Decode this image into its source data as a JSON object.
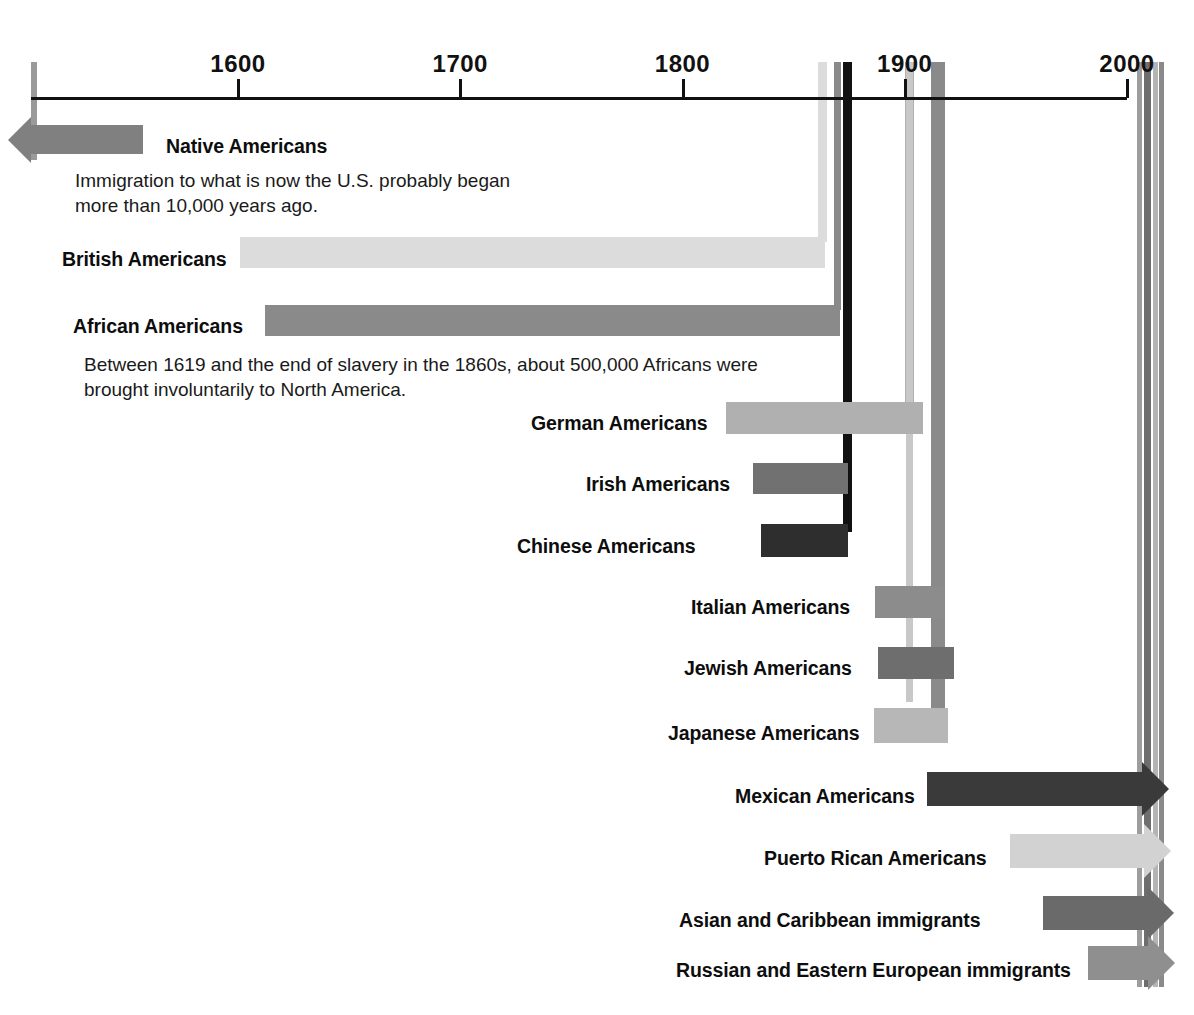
{
  "chart_data": {
    "type": "bar",
    "orientation": "horizontal-timeline",
    "title": "",
    "xlabel": "",
    "ylabel": "",
    "grid": false,
    "legend": null,
    "axis": {
      "ticks": [
        {
          "label": "1600",
          "value": 1600
        },
        {
          "label": "1700",
          "value": 1700
        },
        {
          "label": "1800",
          "value": 1800
        },
        {
          "label": "1900",
          "value": 1900
        },
        {
          "label": "2000",
          "value": 2000
        }
      ],
      "xlim": [
        1540,
        2010
      ]
    },
    "categories": [
      "Native Americans",
      "British Americans",
      "African Americans",
      "German Americans",
      "Irish Americans",
      "Chinese Americans",
      "Italian Americans",
      "Jewish Americans",
      "Japanese Americans",
      "Mexican Americans",
      "Puerto Rican Americans",
      "Asian and Caribbean immigrants",
      "Russian and Eastern European immigrants"
    ],
    "bars": [
      {
        "label": "Native Americans",
        "start": 1540,
        "end": 1600,
        "open_start": true,
        "open_end": false,
        "color": "#808080"
      },
      {
        "label": "British Americans",
        "start": 1600,
        "end": 1893,
        "open_start": false,
        "open_end": false,
        "color": "#dcdcdc"
      },
      {
        "label": "African Americans",
        "start": 1619,
        "end": 1900,
        "open_start": false,
        "open_end": false,
        "color": "#8a8a8a"
      },
      {
        "label": "German Americans",
        "start": 1828,
        "end": 1917,
        "open_start": false,
        "open_end": false,
        "color": "#b0b0b0"
      },
      {
        "label": "Irish Americans",
        "start": 1845,
        "end": 1899,
        "open_start": false,
        "open_end": false,
        "color": "#717171"
      },
      {
        "label": "Chinese Americans",
        "start": 1850,
        "end": 1900,
        "open_start": false,
        "open_end": false,
        "color": "#2e2e2e"
      },
      {
        "label": "Italian Americans",
        "start": 1880,
        "end": 1924,
        "open_start": false,
        "open_end": false,
        "color": "#8c8c8c"
      },
      {
        "label": "Jewish Americans",
        "start": 1881,
        "end": 1924,
        "open_start": false,
        "open_end": false,
        "color": "#6e6e6e"
      },
      {
        "label": "Japanese Americans",
        "start": 1885,
        "end": 1924,
        "open_start": false,
        "open_end": false,
        "color": "#b7b7b7"
      },
      {
        "label": "Mexican Americans",
        "start": 1910,
        "end": 2005,
        "open_start": false,
        "open_end": true,
        "color": "#3a3a3a"
      },
      {
        "label": "Puerto Rican Americans",
        "start": 1945,
        "end": 2005,
        "open_start": false,
        "open_end": true,
        "color": "#d2d2d2"
      },
      {
        "label": "Asian and Caribbean immigrants",
        "start": 1965,
        "end": 2005,
        "open_start": false,
        "open_end": true,
        "color": "#6a6a6a"
      },
      {
        "label": "Russian and Eastern European immigrants",
        "start": 1975,
        "end": 2005,
        "open_start": false,
        "open_end": true,
        "color": "#8f8f8f"
      }
    ],
    "annotations": [
      {
        "for": "Native Americans",
        "text": "Immigration to what is now the U.S. probably began\nmore than 10,000 years ago."
      },
      {
        "for": "African Americans",
        "text": "Between 1619 and the end of slavery in the 1860s, about 500,000 Africans were\nbrought involuntarily to North America."
      }
    ]
  },
  "rows": [
    {
      "label": "Native Americans",
      "label_x": 166,
      "label_y": 137,
      "bar_x": 31,
      "bar_y": 125,
      "bar_w": 112,
      "bar_h": 29,
      "color": "#808080",
      "arrow": "left",
      "guide_x": 31,
      "guide_color": "#9a9a9a",
      "guide_w": 6,
      "guide_h": 98
    },
    {
      "label": "British Americans",
      "label_x": 62,
      "label_y": 250,
      "bar_x": 240,
      "bar_y": 237,
      "bar_w": 585,
      "bar_h": 31,
      "color": "#dcdcdc",
      "arrow": "none",
      "guide_x": 818,
      "guide_color": "#dcdcdc",
      "guide_w": 9,
      "guide_h": 180
    },
    {
      "label": "African Americans",
      "label_x": 73,
      "label_y": 317,
      "bar_x": 265,
      "bar_y": 305,
      "bar_w": 575,
      "bar_h": 31,
      "color": "#8a8a8a",
      "arrow": "none",
      "guide_x": 834,
      "guide_color": "#8a8a8a",
      "guide_w": 7,
      "guide_h": 248
    },
    {
      "label": "German Americans",
      "label_x": 531,
      "label_y": 414,
      "bar_x": 726,
      "bar_y": 402,
      "bar_w": 197,
      "bar_h": 32,
      "color": "#b0b0b0",
      "arrow": "none",
      "guide_x": 905,
      "guide_color": "#b0b0b0",
      "guide_w": 9,
      "guide_h": 345
    },
    {
      "label": "Irish Americans",
      "label_x": 586,
      "label_y": 475,
      "bar_x": 753,
      "bar_y": 463,
      "bar_w": 95,
      "bar_h": 31,
      "color": "#717171",
      "arrow": "none",
      "guide_x": 850,
      "guide_color": "#8a8a8a",
      "guide_w": 0,
      "guide_h": 0
    },
    {
      "label": "Chinese Americans",
      "label_x": 517,
      "label_y": 537,
      "bar_x": 761,
      "bar_y": 524,
      "bar_w": 87,
      "bar_h": 33,
      "color": "#2e2e2e",
      "arrow": "none",
      "guide_x": 843,
      "guide_color": "#111111",
      "guide_w": 9,
      "guide_h": 470
    },
    {
      "label": "Italian Americans",
      "label_x": 691,
      "label_y": 598,
      "bar_x": 875,
      "bar_y": 586,
      "bar_w": 69,
      "bar_h": 32,
      "color": "#8c8c8c",
      "arrow": "none",
      "guide_x": 931,
      "guide_color": "#8a8a8a",
      "guide_w": 14,
      "guide_h": 660
    },
    {
      "label": "Jewish Americans",
      "label_x": 684,
      "label_y": 659,
      "bar_x": 878,
      "bar_y": 647,
      "bar_w": 76,
      "bar_h": 32,
      "color": "#6e6e6e",
      "arrow": "none",
      "guide_x": 0,
      "guide_color": "",
      "guide_w": 0,
      "guide_h": 0
    },
    {
      "label": "Japanese Americans",
      "label_x": 668,
      "label_y": 724,
      "bar_x": 874,
      "bar_y": 708,
      "bar_w": 74,
      "bar_h": 35,
      "color": "#b7b7b7",
      "arrow": "none",
      "guide_x": 906,
      "guide_color": "#c8c8c8",
      "guide_w": 7,
      "guide_h": 640
    },
    {
      "label": "Mexican Americans",
      "label_x": 735,
      "label_y": 787,
      "bar_x": 927,
      "bar_y": 772,
      "bar_w": 215,
      "bar_h": 34,
      "color": "#3a3a3a",
      "arrow": "right",
      "guide_x": 0,
      "guide_color": "",
      "guide_w": 0,
      "guide_h": 0
    },
    {
      "label": "Puerto Rican Americans",
      "label_x": 764,
      "label_y": 849,
      "bar_x": 1010,
      "bar_y": 834,
      "bar_w": 134,
      "bar_h": 34,
      "color": "#d2d2d2",
      "arrow": "right",
      "guide_x": 0,
      "guide_color": "",
      "guide_w": 0,
      "guide_h": 0
    },
    {
      "label": "Asian and Caribbean immigrants",
      "label_x": 679,
      "label_y": 911,
      "bar_x": 1043,
      "bar_y": 896,
      "bar_w": 104,
      "bar_h": 34,
      "color": "#6a6a6a",
      "arrow": "right",
      "guide_x": 0,
      "guide_color": "",
      "guide_w": 0,
      "guide_h": 0
    },
    {
      "label": "Russian and Eastern European immigrants",
      "label_x": 676,
      "label_y": 961,
      "bar_x": 1088,
      "bar_y": 946,
      "bar_w": 60,
      "bar_h": 34,
      "color": "#8f8f8f",
      "arrow": "right",
      "guide_x": 0,
      "guide_color": "",
      "guide_w": 0,
      "guide_h": 0
    }
  ],
  "captions": [
    {
      "text": "Immigration to what is now the U.S. probably began\nmore than 10,000 years ago.",
      "x": 75,
      "y": 168
    },
    {
      "text": "Between 1619 and the end of slavery in the 1860s, about 500,000 Africans were\nbrought involuntarily to North America.",
      "x": 84,
      "y": 352
    }
  ],
  "right_guides": [
    {
      "x": 1137,
      "color": "#9d9d9d",
      "w": 5,
      "top": 62,
      "h": 925
    },
    {
      "x": 1144,
      "color": "#6e6e6e",
      "w": 7,
      "top": 62,
      "h": 925
    },
    {
      "x": 1153,
      "color": "#b4b4b4",
      "w": 5,
      "top": 62,
      "h": 925
    },
    {
      "x": 1159,
      "color": "#8a8a8a",
      "w": 5,
      "top": 62,
      "h": 925
    }
  ]
}
